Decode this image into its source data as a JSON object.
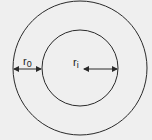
{
  "diagram": {
    "type": "concentric-circles",
    "labels": {
      "outer_thickness": "r",
      "outer_thickness_sub": "0",
      "inner_radius": "r",
      "inner_radius_sub": "i"
    },
    "colors": {
      "background": "#efefef",
      "stroke": "#2a2a2a"
    }
  }
}
